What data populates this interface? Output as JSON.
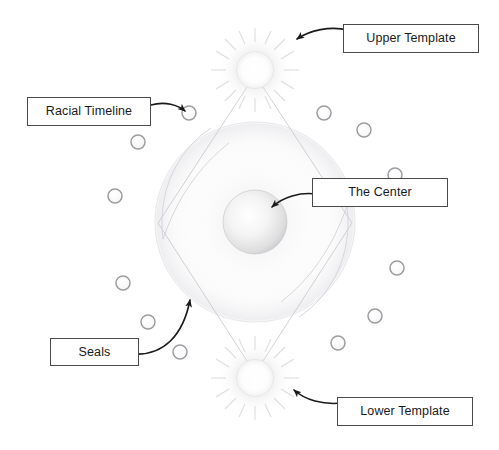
{
  "diagram": {
    "title": "",
    "background_color": "#ffffff",
    "callouts": [
      {
        "id": "upper-template",
        "label": "Upper Template",
        "box": {
          "x": 343,
          "y": 24,
          "width": 136,
          "height": 29
        },
        "leader_line": {
          "from": [
            348,
            30
          ],
          "to": [
            296,
            40
          ],
          "arrow_at": [
            296,
            40
          ]
        }
      },
      {
        "id": "racial-timeline",
        "label": "Racial Timeline",
        "box": {
          "x": 27,
          "y": 97,
          "width": 124,
          "height": 29
        },
        "leader_line": {
          "from": [
            151,
            105
          ],
          "to": [
            186,
            113
          ],
          "arrow_at": [
            186,
            113
          ]
        }
      },
      {
        "id": "the-center",
        "label": "The Center",
        "box": {
          "x": 312,
          "y": 178,
          "width": 136,
          "height": 29
        },
        "leader_line": {
          "from": [
            316,
            193
          ],
          "to": [
            270,
            208
          ],
          "arrow_at": [
            270,
            208
          ]
        }
      },
      {
        "id": "seals",
        "label": "Seals",
        "box": {
          "x": 50,
          "y": 338,
          "width": 89,
          "height": 28
        },
        "leader_line": {
          "from": [
            139,
            354
          ],
          "to": [
            190,
            297
          ],
          "arrow_at": [
            190,
            297
          ]
        }
      },
      {
        "id": "lower-template",
        "label": "Lower Template",
        "box": {
          "x": 337,
          "y": 397,
          "width": 136,
          "height": 29
        },
        "leader_line": {
          "from": [
            342,
            404
          ],
          "to": [
            292,
            390
          ],
          "arrow_at": [
            292,
            390
          ]
        }
      }
    ],
    "shapes": {
      "upper_template_sphere": {
        "cx": 255,
        "cy": 70,
        "r": 18,
        "kind": "radiant-sphere"
      },
      "lower_template_sphere": {
        "cx": 255,
        "cy": 378,
        "r": 18,
        "kind": "radiant-sphere"
      },
      "center_sphere": {
        "cx": 255,
        "cy": 222,
        "r": 32,
        "kind": "gray-sphere"
      },
      "outer_circle": {
        "cx": 255,
        "cy": 222,
        "r": 100,
        "kind": "faint-outline"
      },
      "diamond_lines": [
        {
          "from": [
            247,
            88
          ],
          "to": [
            160,
            222
          ]
        },
        {
          "from": [
            263,
            88
          ],
          "to": [
            350,
            222
          ]
        },
        {
          "from": [
            160,
            222
          ],
          "to": [
            247,
            360
          ]
        },
        {
          "from": [
            350,
            222
          ],
          "to": [
            263,
            360
          ]
        }
      ],
      "arcs": [
        {
          "kind": "upper-left-crescent"
        },
        {
          "kind": "lower-right-crescent"
        }
      ],
      "seal_circles": [
        {
          "cx": 189,
          "cy": 113,
          "r": 7
        },
        {
          "cx": 138,
          "cy": 142,
          "r": 7
        },
        {
          "cx": 115,
          "cy": 196,
          "r": 7
        },
        {
          "cx": 123,
          "cy": 283,
          "r": 7
        },
        {
          "cx": 148,
          "cy": 322,
          "r": 7
        },
        {
          "cx": 180,
          "cy": 352,
          "r": 7
        },
        {
          "cx": 324,
          "cy": 113,
          "r": 7
        },
        {
          "cx": 364,
          "cy": 130,
          "r": 7
        },
        {
          "cx": 395,
          "cy": 175,
          "r": 7
        },
        {
          "cx": 397,
          "cy": 268,
          "r": 7
        },
        {
          "cx": 375,
          "cy": 316,
          "r": 7
        },
        {
          "cx": 338,
          "cy": 343,
          "r": 7
        }
      ]
    },
    "colors": {
      "box_border": "#4a4a4a",
      "text": "#1a1a1a",
      "arrow": "#1a1a1a",
      "seal_outline": "#9a9a9e",
      "faint_line": "#d9d9dd",
      "sphere_gray": "#cfcfd2"
    }
  }
}
